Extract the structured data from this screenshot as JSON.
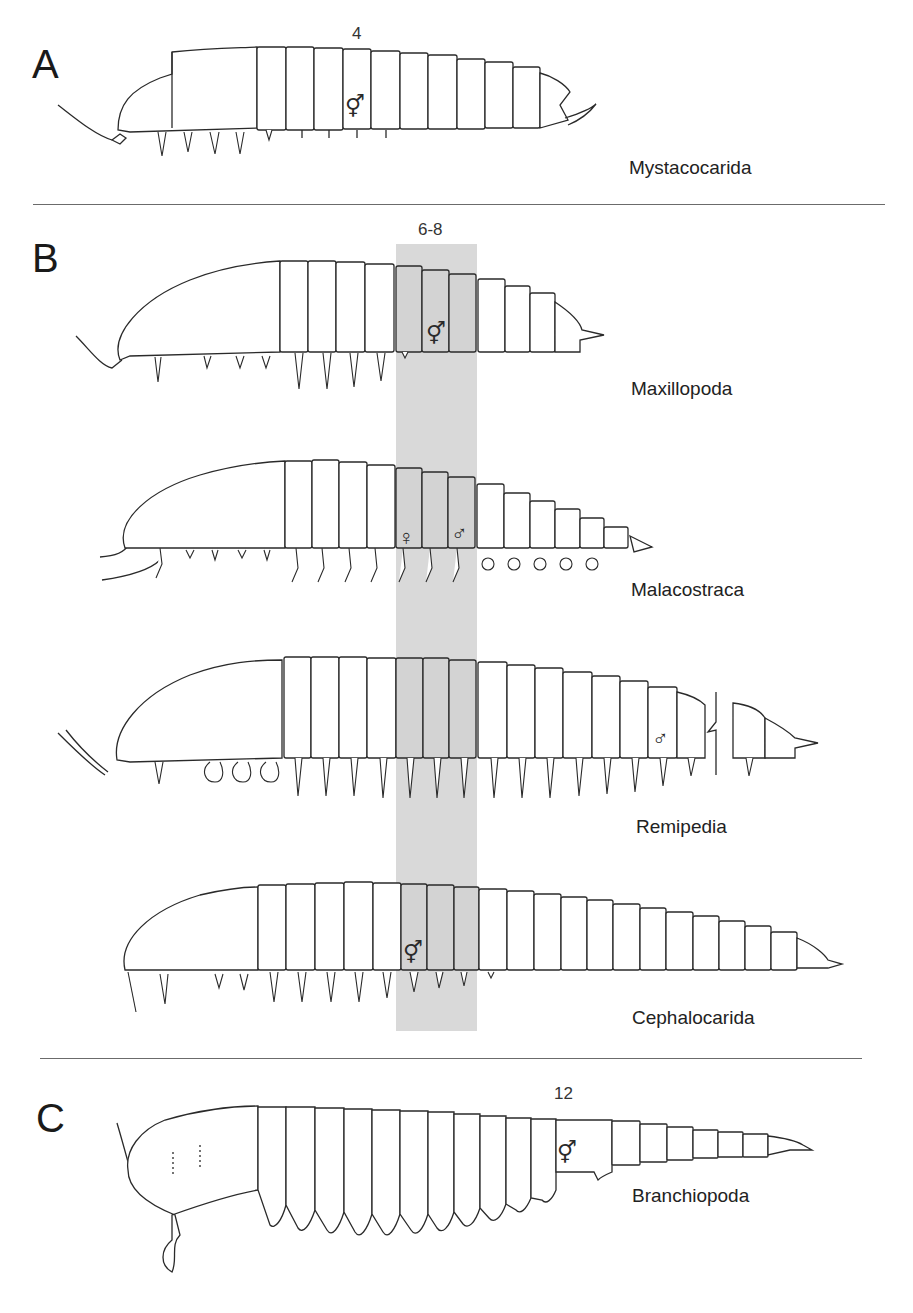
{
  "figure": {
    "panels": [
      {
        "letter": "A",
        "segment_count_label": "4",
        "taxa": [
          {
            "name": "Mystacocarida",
            "gonopore_symbol": "⚥"
          }
        ]
      },
      {
        "letter": "B",
        "segment_count_label": "6-8",
        "highlight_band_color": "#d9d9d9",
        "taxa": [
          {
            "name": "Maxillopoda",
            "gonopore_symbol": "⚥"
          },
          {
            "name": "Malacostraca",
            "gonopore_symbols": [
              "♀",
              "♂"
            ]
          },
          {
            "name": "Remipedia",
            "gonopore_symbol": "♂"
          },
          {
            "name": "Cephalocarida",
            "gonopore_symbol": "⚥"
          }
        ]
      },
      {
        "letter": "C",
        "segment_count_label": "12",
        "taxa": [
          {
            "name": "Branchiopoda",
            "gonopore_symbol": "⚥"
          }
        ]
      }
    ],
    "divider_color": "#6b6b6b"
  }
}
